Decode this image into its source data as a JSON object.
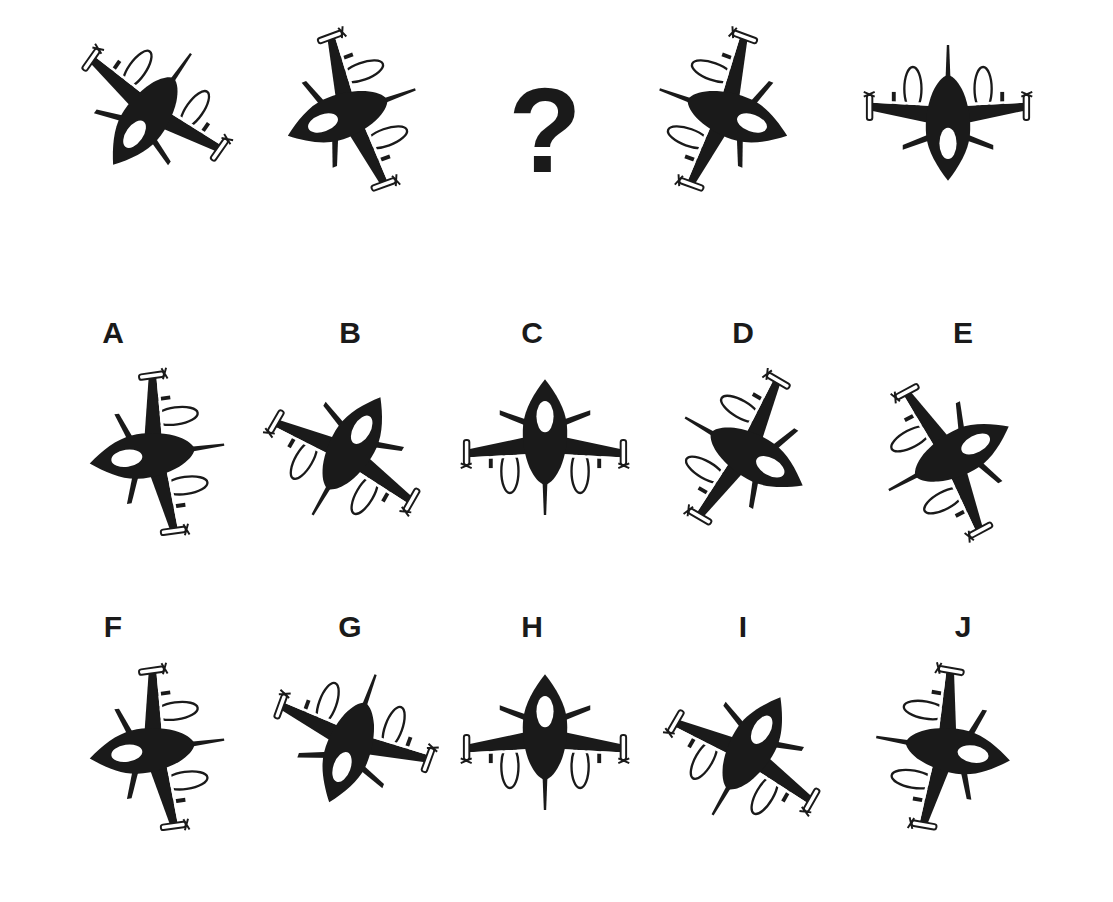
{
  "puzzle": {
    "sequence": [
      {
        "id": "seq-1",
        "cx": 148,
        "cy": 115,
        "rotate": 215,
        "mirror": false
      },
      {
        "id": "seq-2",
        "cx": 345,
        "cy": 115,
        "rotate": 250,
        "mirror": true
      },
      {
        "id": "seq-3",
        "placeholder": "?"
      },
      {
        "id": "seq-4",
        "cx": 730,
        "cy": 115,
        "rotate": 110,
        "mirror": false
      },
      {
        "id": "seq-5",
        "cx": 948,
        "cy": 120,
        "rotate": 180,
        "mirror": false
      }
    ],
    "question_mark": "?"
  },
  "options": [
    {
      "label": "A",
      "label_x": 98,
      "label_y": 318,
      "cx": 150,
      "cy": 455,
      "rotate": 262,
      "mirror": true
    },
    {
      "label": "B",
      "label_x": 335,
      "label_y": 318,
      "cx": 350,
      "cy": 450,
      "rotate": 30,
      "mirror": true
    },
    {
      "label": "C",
      "label_x": 517,
      "label_y": 318,
      "cx": 545,
      "cy": 440,
      "rotate": 0,
      "mirror": false
    },
    {
      "label": "D",
      "label_x": 728,
      "label_y": 318,
      "cx": 750,
      "cy": 455,
      "rotate": 120,
      "mirror": true
    },
    {
      "label": "E",
      "label_x": 948,
      "label_y": 318,
      "cx": 955,
      "cy": 455,
      "rotate": 62,
      "mirror": false
    },
    {
      "label": "F",
      "label_x": 98,
      "label_y": 612,
      "cx": 150,
      "cy": 750,
      "rotate": 262,
      "mirror": false
    },
    {
      "label": "G",
      "label_x": 335,
      "label_y": 612,
      "cx": 350,
      "cy": 745,
      "rotate": 200,
      "mirror": true
    },
    {
      "label": "H",
      "label_x": 517,
      "label_y": 612,
      "cx": 545,
      "cy": 735,
      "rotate": 0,
      "mirror": true
    },
    {
      "label": "I",
      "label_x": 728,
      "label_y": 612,
      "cx": 750,
      "cy": 750,
      "rotate": 30,
      "mirror": false
    },
    {
      "label": "J",
      "label_x": 948,
      "label_y": 612,
      "cx": 950,
      "cy": 750,
      "rotate": 100,
      "mirror": true
    }
  ],
  "colors": {
    "silhouette": "#1a1a1a",
    "background": "#ffffff",
    "outline": "#1a1a1a"
  },
  "icons": {
    "jet": "fighter-jet-silhouette",
    "question": "question-mark"
  }
}
